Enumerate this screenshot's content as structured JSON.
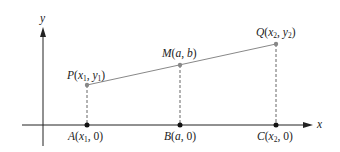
{
  "diagram": {
    "type": "coordinate-geometry",
    "axes": {
      "x_label": "x",
      "y_label": "y"
    },
    "points": {
      "P": {
        "name": "P",
        "args": [
          "x",
          "1",
          "y",
          "1"
        ],
        "display": "P(x1, y1)"
      },
      "M": {
        "name": "M",
        "display": "M(a, b)",
        "a": "a",
        "b": "b"
      },
      "Q": {
        "name": "Q",
        "display": "Q(x2, y2)"
      },
      "A": {
        "name": "A",
        "display": "A(x1, 0)"
      },
      "B": {
        "name": "B",
        "display": "B(a, 0)"
      },
      "C": {
        "name": "C",
        "display": "C(x2, 0)"
      }
    },
    "labels": {
      "P_name": "P",
      "P_x": "x",
      "P_xsub": "1",
      "P_y": "y",
      "P_ysub": "1",
      "M_name": "M",
      "M_a": "a",
      "M_b": "b",
      "Q_name": "Q",
      "Q_x": "x",
      "Q_xsub": "2",
      "Q_y": "y",
      "Q_ysub": "2",
      "A_name": "A",
      "A_x": "x",
      "A_xsub": "1",
      "A_zero": "0",
      "B_name": "B",
      "B_a": "a",
      "B_zero": "0",
      "C_name": "C",
      "C_x": "x",
      "C_xsub": "2",
      "C_zero": "0",
      "open": "(",
      "comma": ", ",
      "close": ")"
    },
    "colors": {
      "axis": "#222222",
      "segment": "#888888",
      "dashed": "#666666",
      "point_on_axis": "#111111",
      "point_on_segment": "#888888"
    }
  }
}
